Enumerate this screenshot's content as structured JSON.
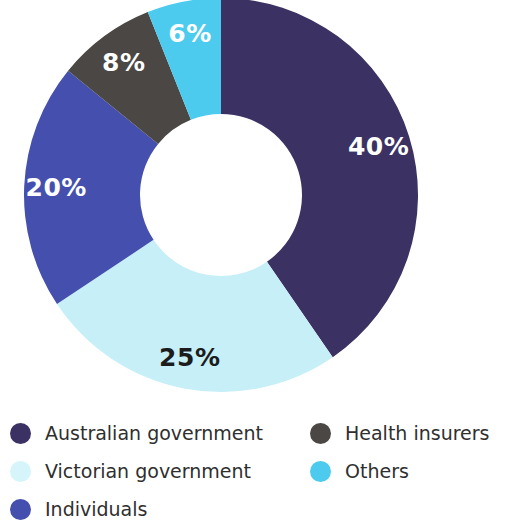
{
  "chart_data": {
    "type": "pie",
    "title": "",
    "subtitle": "",
    "xlabel": "",
    "ylabel": "",
    "donut": true,
    "hole_ratio": 0.41,
    "legend_position": "bottom",
    "grid": false,
    "start_angle_deg": 0,
    "direction": "clockwise",
    "categories": [
      "Australian government",
      "Victorian government",
      "Individuals",
      "Health insurers",
      "Others"
    ],
    "values": [
      40,
      25,
      20,
      8,
      6
    ],
    "value_labels": [
      "40%",
      "25%",
      "20%",
      "8%",
      "6%"
    ],
    "colors": [
      "#3c3163",
      "#c6eff8",
      "#4550ae",
      "#4a4744",
      "#4ccbee"
    ],
    "label_text_colors": [
      "#ffffff",
      "#1c1c1c",
      "#ffffff",
      "#ffffff",
      "#ffffff"
    ],
    "units": "percent",
    "total": 99
  },
  "donut": {
    "slices": [
      {
        "name": "Australian government",
        "label": "40%",
        "value": 40,
        "color": "#3c3163",
        "label_color": "light"
      },
      {
        "name": "Victorian government",
        "label": "25%",
        "value": 25,
        "color": "#c6eff8",
        "label_color": "dark"
      },
      {
        "name": "Individuals",
        "label": "20%",
        "value": 20,
        "color": "#4550ae",
        "label_color": "light"
      },
      {
        "name": "Health insurers",
        "label": "8%",
        "value": 8,
        "color": "#4a4744",
        "label_color": "light"
      },
      {
        "name": "Others",
        "label": "6%",
        "value": 6,
        "color": "#4ccbee",
        "label_color": "light"
      }
    ]
  },
  "legend": {
    "left_column": [
      {
        "label": "Australian government",
        "color": "#3c3163"
      },
      {
        "label": "Victorian government",
        "color": "#d6f5fb"
      },
      {
        "label": "Individuals",
        "color": "#4550ae"
      }
    ],
    "right_column": [
      {
        "label": "Health insurers",
        "color": "#4a4744"
      },
      {
        "label": "Others",
        "color": "#4ccbee"
      }
    ]
  }
}
